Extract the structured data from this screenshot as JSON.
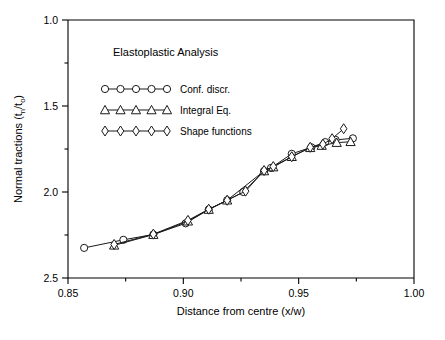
{
  "figure": {
    "background": "#ffffff",
    "foreground": "#000000",
    "title_in_plot": "Elastoplastic Analysis"
  },
  "axes": {
    "x_title": "Distance from centre (x/w)",
    "y_title_main": "Normal tractions (t",
    "y_title_sub1": "n",
    "y_title_mid": "/t",
    "y_title_sub2": "o",
    "y_title_end": ")",
    "x_ticks": [
      "0.85",
      "0.90",
      "0.95",
      "1.00"
    ],
    "y_ticks": [
      "2.5",
      "2.0",
      "1.5",
      "1.0"
    ]
  },
  "legend": {
    "entries": [
      {
        "label": "Conf. discr.",
        "marker": "circle"
      },
      {
        "label": "Integral Eq.",
        "marker": "triangle"
      },
      {
        "label": "Shape functions",
        "marker": "diamond"
      }
    ]
  },
  "chart_data": {
    "type": "line",
    "title": "Elastoplastic Analysis",
    "xlabel": "Distance from centre (x/w)",
    "ylabel": "Normal tractions (tn/to)",
    "xlim": [
      0.85,
      1.0
    ],
    "ylim": [
      1.0,
      2.5
    ],
    "xticks": [
      0.85,
      0.9,
      0.95,
      1.0
    ],
    "yticks": [
      1.0,
      1.5,
      2.0,
      2.5
    ],
    "grid": false,
    "legend_position": "upper-left-inside",
    "series": [
      {
        "name": "Conf. discr.",
        "marker": "circle",
        "x": [
          0.857,
          0.874,
          0.887,
          0.901,
          0.911,
          0.919,
          0.926,
          0.935,
          0.938,
          0.947,
          0.9555,
          0.9615,
          0.966,
          0.9735
        ],
        "y": [
          1.175,
          1.222,
          1.253,
          1.318,
          1.398,
          1.452,
          1.5,
          1.622,
          1.64,
          1.722,
          1.76,
          1.79,
          1.803,
          1.812
        ]
      },
      {
        "name": "Integral Eq.",
        "marker": "triangle",
        "x": [
          0.87,
          0.887,
          0.902,
          0.911,
          0.919,
          0.935,
          0.939,
          0.947,
          0.955,
          0.96,
          0.9665,
          0.9725
        ],
        "y": [
          1.19,
          1.252,
          1.33,
          1.398,
          1.452,
          1.622,
          1.645,
          1.705,
          1.757,
          1.77,
          1.787,
          1.792
        ]
      },
      {
        "name": "Shape functions",
        "marker": "diamond",
        "x": [
          0.87,
          0.887,
          0.902,
          0.911,
          0.919,
          0.927,
          0.935,
          0.939,
          0.947,
          0.955,
          0.9605,
          0.9645,
          0.9695
        ],
        "y": [
          1.195,
          1.255,
          1.335,
          1.4,
          1.452,
          1.505,
          1.625,
          1.648,
          1.705,
          1.76,
          1.778,
          1.81,
          1.868
        ]
      }
    ]
  }
}
